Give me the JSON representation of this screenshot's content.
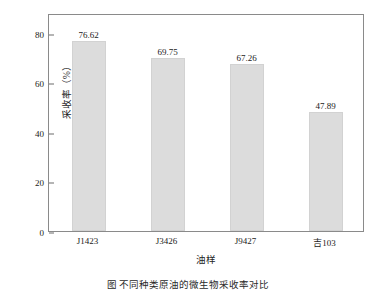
{
  "chart_data": {
    "type": "bar",
    "title": "",
    "xlabel": "油样",
    "ylabel": "采收率（%）",
    "categories": [
      "J1423",
      "J3426",
      "J9427",
      "吉103"
    ],
    "values": [
      76.62,
      69.75,
      67.26,
      47.89
    ],
    "value_labels": [
      "76.62",
      "69.75",
      "67.26",
      "47.89"
    ],
    "ylim": [
      0,
      88
    ],
    "yticks": [
      0,
      20,
      40,
      60,
      80
    ],
    "ytick_labels": [
      "0",
      "20",
      "40",
      "60",
      "80"
    ],
    "grid": false,
    "legend": null,
    "bar_color": "#dcdcdc",
    "bar_edge_color": "#d2d2d2",
    "axis_color": "#8a8a8a",
    "text_color": "#222222"
  },
  "caption": {
    "text": "图   不同种类原油的微生物采收率对比"
  }
}
